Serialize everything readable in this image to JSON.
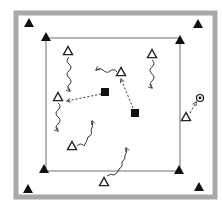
{
  "diagram": {
    "type": "soccer-drill",
    "colors": {
      "background": "#ffffff",
      "outer_frame": "#a9a9a9",
      "inner_line": "#6e6e6e",
      "cone": "#111111",
      "player_outline": "#222222",
      "defender": "#111111",
      "movement": "#333333"
    },
    "outer_frame": {
      "x": 16,
      "y": 13,
      "w": 199,
      "h": 184,
      "stroke": 5
    },
    "inner_square": {
      "x": 46,
      "y": 38,
      "w": 134,
      "h": 133
    },
    "outer_cones": [
      {
        "x": 29,
        "y": 23
      },
      {
        "x": 198,
        "y": 24
      },
      {
        "x": 28,
        "y": 189
      },
      {
        "x": 199,
        "y": 187
      }
    ],
    "inner_cones": [
      {
        "x": 46,
        "y": 37
      },
      {
        "x": 180,
        "y": 40
      },
      {
        "x": 44,
        "y": 169
      },
      {
        "x": 179,
        "y": 170
      }
    ],
    "players": [
      {
        "id": "p1",
        "x": 68,
        "y": 51
      },
      {
        "id": "p2",
        "x": 121,
        "y": 72
      },
      {
        "id": "p3",
        "x": 152,
        "y": 54
      },
      {
        "id": "p4",
        "x": 58,
        "y": 97
      },
      {
        "id": "p5",
        "x": 72,
        "y": 146
      },
      {
        "id": "p6",
        "x": 104,
        "y": 182
      },
      {
        "id": "p7",
        "x": 186,
        "y": 117
      }
    ],
    "defenders": [
      {
        "id": "d1",
        "x": 105,
        "y": 92
      },
      {
        "id": "d2",
        "x": 135,
        "y": 113
      }
    ],
    "ball": {
      "x": 200,
      "y": 98
    },
    "dribbles": [
      {
        "from": "p1",
        "path": "M69,57 q-4,4 0,7 q4,3 0,7 q-4,3 0,7 q4,3 0,7 q-3,3 1,6",
        "end": [
          76,
          93
        ]
      },
      {
        "from": "p2",
        "path": "M117,72 q-3,-4 -7,-1 q-3,3 -7,-1 q-3,-3 -7,0",
        "end": [
          96,
          67
        ]
      },
      {
        "from": "p3",
        "path": "M152,60 q4,3 0,7 q-4,3 0,7 q4,3 0,7 q-4,3 0,7",
        "end": [
          148,
          92
        ]
      },
      {
        "from": "p4",
        "path": "M58,103 q4,3 0,7 q-4,3 0,7 q4,3 0,7 q-4,3 0,7",
        "end": [
          57,
          130
        ]
      },
      {
        "from": "p5",
        "path": "M77,146 q4,-4 7,0 q3,-5 4,-9 q5,-2 3,-7 q3,-4 1,-9",
        "end": [
          93,
          119
        ]
      },
      {
        "from": "p6",
        "path": "M107,176 q4,-3 7,-1 q4,-2 5,-6 q4,-2 3,-7 q4,-3 3,-7 q3,-3 1,-7",
        "end": [
          126,
          141
        ]
      }
    ],
    "passes": [
      {
        "from": [
          101,
          94
        ],
        "to": [
          67,
          101
        ]
      },
      {
        "from": [
          133,
          108
        ],
        "to": [
          121,
          79
        ]
      },
      {
        "from": [
          190,
          113
        ],
        "to": [
          196,
          102
        ]
      }
    ]
  }
}
